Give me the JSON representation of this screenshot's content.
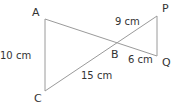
{
  "diagram": {
    "points": {
      "A": {
        "label": "A"
      },
      "B": {
        "label": "B"
      },
      "C": {
        "label": "C"
      },
      "P": {
        "label": "P"
      },
      "Q": {
        "label": "Q"
      }
    },
    "lengths": {
      "AC": "10 cm",
      "BP": "9 cm",
      "BQ": "6 cm",
      "BC": "15 cm"
    },
    "line_color": "#999999"
  }
}
